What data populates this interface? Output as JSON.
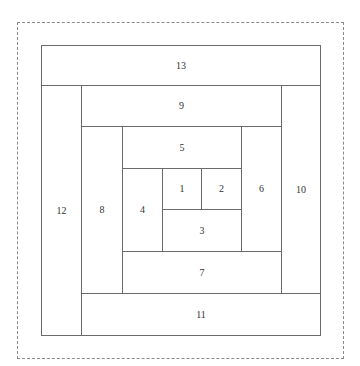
{
  "diagram": {
    "title": "",
    "frame": {
      "style": "dashed",
      "color": "#8a8a8a"
    },
    "line_color": "#6a6a6a",
    "text_color": "#333333",
    "blocks": [
      {
        "label": "1",
        "x": 162,
        "y": 168,
        "w": 40,
        "h": 42
      },
      {
        "label": "2",
        "x": 201,
        "y": 168,
        "w": 41,
        "h": 42
      },
      {
        "label": "3",
        "x": 162,
        "y": 209,
        "w": 80,
        "h": 43
      },
      {
        "label": "4",
        "x": 122,
        "y": 168,
        "w": 41,
        "h": 84
      },
      {
        "label": "5",
        "x": 122,
        "y": 126,
        "w": 120,
        "h": 43
      },
      {
        "label": "6",
        "x": 241,
        "y": 126,
        "w": 41,
        "h": 126
      },
      {
        "label": "7",
        "x": 122,
        "y": 251,
        "w": 160,
        "h": 43
      },
      {
        "label": "8",
        "x": 81,
        "y": 126,
        "w": 42,
        "h": 168
      },
      {
        "label": "9",
        "x": 81,
        "y": 85,
        "w": 201,
        "h": 42
      },
      {
        "label": "10",
        "x": 281,
        "y": 85,
        "w": 40,
        "h": 209
      },
      {
        "label": "11",
        "x": 81,
        "y": 293,
        "w": 240,
        "h": 43
      },
      {
        "label": "12",
        "x": 41,
        "y": 85,
        "w": 41,
        "h": 251
      },
      {
        "label": "13",
        "x": 41,
        "y": 45,
        "w": 280,
        "h": 41
      }
    ]
  }
}
